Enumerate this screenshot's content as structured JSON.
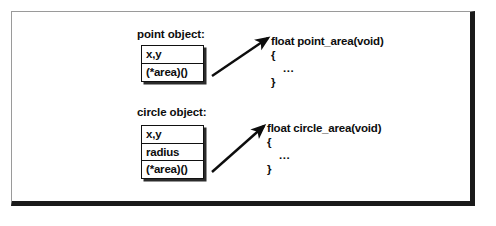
{
  "figure": {
    "objects": [
      {
        "id": "point",
        "caption": "point object:",
        "fields": [
          "x,y",
          "(*area)()"
        ]
      },
      {
        "id": "circle",
        "caption": "circle object:",
        "fields": [
          "x,y",
          "radius",
          "(*area)()"
        ]
      }
    ],
    "functions": [
      {
        "id": "point_area",
        "signature": "float  point_area(void)",
        "open_brace": "{",
        "body": "...",
        "close_brace": "}"
      },
      {
        "id": "circle_area",
        "signature": "float  circle_area(void)",
        "open_brace": "{",
        "body": "...",
        "close_brace": "}"
      }
    ],
    "colors": {
      "ink": "#0d0d0d",
      "frame_shadow": "#1a1a1a",
      "frame_light": "#9a9a9a",
      "background": "#ffffff"
    }
  }
}
